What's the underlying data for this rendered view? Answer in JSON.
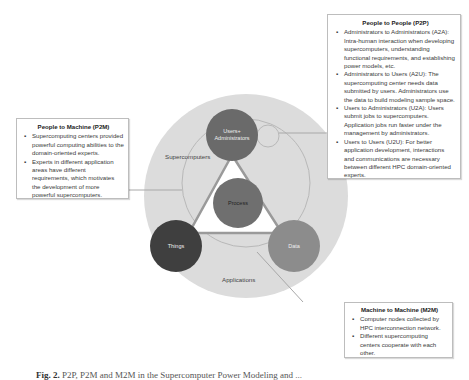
{
  "diagram": {
    "outer_ring_labels": {
      "top_left": "Supercomputers",
      "bottom": "Applications"
    },
    "nodes": {
      "top": "Users+ Administrators",
      "top_line1": "Users+",
      "top_line2": "Administrators",
      "center": "Process",
      "left": "Things",
      "right": "Data"
    },
    "colors": {
      "outer_circle": "#dcdcdc",
      "users_admins": "#6a6a6a",
      "process": "#6f6f6f",
      "things": "#3f3f3f",
      "data": "#8c8c8c",
      "triangle": "#9a9a9a"
    }
  },
  "callouts": {
    "p2p": {
      "title": "People to People (P2P)",
      "items": [
        "Administrators to Administrators (A2A): Intra-human interaction when developing supercomputers, understanding functional requirements, and establishing power models, etc.",
        "Administrators to Users (A2U): The supercomputing center needs data submitted by users. Administrators use the data to build modeling sample space.",
        "Users to Administrators (U2A): Users submit jobs to supercomputers. Application jobs run faster under the management by administrators.",
        "Users to Users (U2U): For better application development, interactions and communications are necessary between different HPC domain-oriented experts."
      ]
    },
    "p2m": {
      "title": "People to Machine (P2M)",
      "items": [
        "Supercomputing centers provided powerful computing abilities to the domain-oriented experts.",
        "Experts in different application areas have different requirements, which motivates the development of more powerful supercomputers."
      ]
    },
    "m2m": {
      "title": "Machine to Machine (M2M)",
      "items": [
        "Computer nodes collected by HPC interconnection network.",
        "Different supercomputing centers cooperate with each other."
      ]
    }
  },
  "caption": {
    "label": "Fig. 2.",
    "text": "P2P, P2M and M2M in the Supercomputer Power Modeling and ..."
  }
}
